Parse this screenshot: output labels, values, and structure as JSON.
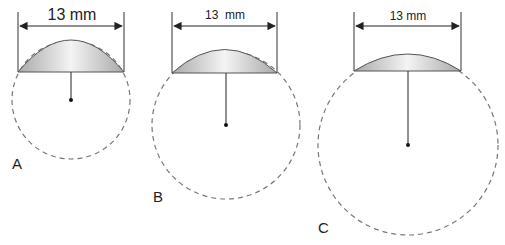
{
  "figure": {
    "panels": [
      {
        "label": "A",
        "dimension": "13 mm",
        "cap_width_mm": 13
      },
      {
        "label": "B",
        "dimension": "13  mm",
        "cap_width_mm": 13
      },
      {
        "label": "C",
        "dimension": "13 mm",
        "cap_width_mm": 13
      }
    ],
    "colors": {
      "cap_fill": "#d8d8d8",
      "dashed_circle": "#777777",
      "line": "#222222"
    }
  }
}
